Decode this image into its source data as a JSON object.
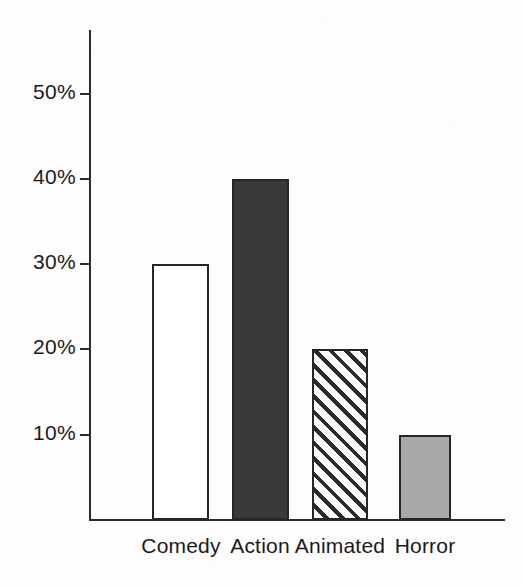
{
  "chart_data": {
    "type": "bar",
    "title": "",
    "subtitle": "",
    "xlabel": "",
    "ylabel": "",
    "categories": [
      "Comedy",
      "Action",
      "Animated",
      "Horror"
    ],
    "values": [
      30,
      20,
      20,
      10
    ],
    "series": [
      {
        "name": "",
        "values": [
          30,
          40,
          20,
          10
        ]
      }
    ],
    "value_suffix": "%",
    "ylim": [
      0,
      57
    ],
    "y_ticks": [
      10,
      20,
      30,
      40,
      50
    ],
    "y_tick_labels": [
      "10%",
      "20%",
      "30%",
      "40%",
      "50%"
    ],
    "grid": false,
    "legend": false,
    "legend_position": "none",
    "bar_styles": [
      {
        "category": "Comedy",
        "value": 30,
        "fill": "white",
        "fill_color": "#ffffff",
        "edge_color": "#262626"
      },
      {
        "category": "Action",
        "value": 40,
        "fill": "solid",
        "fill_color": "#3a3a3a",
        "edge_color": "#262626"
      },
      {
        "category": "Animated",
        "value": 20,
        "fill": "hatch-diagonal",
        "fill_color": "#ffffff",
        "edge_color": "#262626"
      },
      {
        "category": "Horror",
        "value": 10,
        "fill": "solid",
        "fill_color": "#a8a8a8",
        "edge_color": "#262626"
      }
    ],
    "colors": {
      "background": "#fdfdfd",
      "axis": "#2b2b2b",
      "text": "#1a1a1a",
      "bar_white": "#ffffff",
      "bar_dark": "#3a3a3a",
      "bar_gray": "#a8a8a8",
      "bar_hatch_line": "#2b2b2b"
    }
  },
  "axes": {
    "y_axis_name": "y-axis",
    "x_axis_name": "x-axis"
  }
}
